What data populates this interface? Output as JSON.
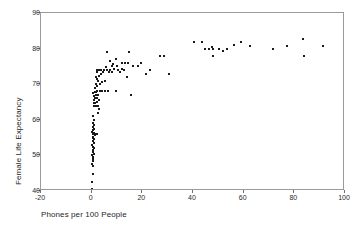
{
  "chart_data": {
    "type": "scatter",
    "title": "",
    "xlabel": "Phones per 100 People",
    "ylabel": "Female Life Expectancy",
    "xlim": [
      -20,
      100
    ],
    "ylim": [
      40,
      90
    ],
    "xticks": [
      -20,
      0,
      20,
      40,
      60,
      80,
      100
    ],
    "yticks": [
      40,
      50,
      60,
      70,
      80,
      90
    ],
    "xtick_labels": [
      "-20",
      "0",
      "20",
      "40",
      "60",
      "80",
      "100"
    ],
    "ytick_labels": [
      "40",
      "50",
      "60",
      "70",
      "80",
      "90"
    ],
    "grid": false,
    "legend": null,
    "marker": "square",
    "marker_color": "#1a1a1a",
    "frame_color": "#9a9a9a",
    "background": "#ffffff",
    "n_points": 123,
    "points": [
      [
        0.2,
        40.5
      ],
      [
        0.3,
        42.5
      ],
      [
        0.4,
        44.8
      ],
      [
        0.5,
        47.0
      ],
      [
        0.3,
        47.5
      ],
      [
        0.6,
        48.5
      ],
      [
        0.4,
        49.0
      ],
      [
        0.7,
        49.5
      ],
      [
        0.3,
        50.0
      ],
      [
        0.8,
        50.5
      ],
      [
        0.5,
        51.0
      ],
      [
        0.4,
        51.5
      ],
      [
        0.9,
        52.0
      ],
      [
        0.6,
        52.5
      ],
      [
        0.3,
        53.0
      ],
      [
        0.8,
        53.5
      ],
      [
        0.5,
        54.0
      ],
      [
        1.0,
        54.5
      ],
      [
        0.4,
        55.0
      ],
      [
        0.7,
        55.3
      ],
      [
        1.2,
        55.8
      ],
      [
        0.5,
        56.0
      ],
      [
        1.6,
        56.0
      ],
      [
        2.2,
        56.0
      ],
      [
        0.9,
        56.2
      ],
      [
        0.3,
        56.5
      ],
      [
        0.6,
        57.0
      ],
      [
        1.1,
        57.5
      ],
      [
        0.4,
        58.0
      ],
      [
        0.8,
        58.6
      ],
      [
        0.5,
        59.2
      ],
      [
        0.9,
        60.0
      ],
      [
        0.6,
        61.0
      ],
      [
        2.6,
        62.0
      ],
      [
        3.0,
        63.0
      ],
      [
        0.8,
        64.0
      ],
      [
        1.3,
        64.0
      ],
      [
        1.9,
        64.0
      ],
      [
        2.4,
        64.0
      ],
      [
        0.9,
        64.6
      ],
      [
        1.5,
        64.8
      ],
      [
        2.1,
        65.0
      ],
      [
        1.0,
        65.5
      ],
      [
        2.8,
        65.6
      ],
      [
        1.4,
        66.0
      ],
      [
        2.0,
        66.2
      ],
      [
        0.8,
        66.8
      ],
      [
        1.6,
        67.0
      ],
      [
        2.5,
        67.0
      ],
      [
        0.6,
        67.4
      ],
      [
        1.2,
        67.8
      ],
      [
        1.8,
        67.9
      ],
      [
        2.3,
        68.0
      ],
      [
        3.1,
        68.0
      ],
      [
        3.9,
        68.0
      ],
      [
        5.2,
        68.0
      ],
      [
        6.6,
        68.0
      ],
      [
        9.5,
        68.0
      ],
      [
        15.6,
        67.0
      ],
      [
        1.4,
        69.0
      ],
      [
        2.2,
        69.5
      ],
      [
        1.9,
        70.0
      ],
      [
        3.3,
        70.0
      ],
      [
        4.2,
        70.6
      ],
      [
        2.6,
        71.0
      ],
      [
        5.4,
        71.0
      ],
      [
        2.0,
        71.5
      ],
      [
        1.7,
        72.0
      ],
      [
        3.0,
        72.2
      ],
      [
        13.8,
        72.0
      ],
      [
        3.8,
        72.8
      ],
      [
        30.7,
        73.0
      ],
      [
        21.4,
        73.0
      ],
      [
        2.2,
        73.4
      ],
      [
        4.6,
        73.5
      ],
      [
        6.8,
        73.5
      ],
      [
        8.1,
        73.4
      ],
      [
        11.2,
        73.5
      ],
      [
        2.0,
        74.0
      ],
      [
        2.7,
        74.0
      ],
      [
        3.5,
        74.0
      ],
      [
        4.9,
        74.0
      ],
      [
        6.0,
        74.0
      ],
      [
        7.2,
        74.0
      ],
      [
        9.0,
        74.2
      ],
      [
        10.4,
        74.0
      ],
      [
        12.0,
        74.2
      ],
      [
        12.9,
        74.0
      ],
      [
        23.2,
        74.0
      ],
      [
        5.8,
        74.8
      ],
      [
        7.9,
        75.0
      ],
      [
        10.0,
        75.0
      ],
      [
        16.2,
        75.0
      ],
      [
        18.3,
        75.2
      ],
      [
        8.6,
        75.8
      ],
      [
        11.8,
        76.0
      ],
      [
        13.2,
        76.0
      ],
      [
        14.5,
        76.0
      ],
      [
        19.6,
        76.0
      ],
      [
        7.4,
        76.6
      ],
      [
        9.8,
        77.0
      ],
      [
        27.0,
        78.0
      ],
      [
        28.4,
        78.0
      ],
      [
        47.8,
        78.0
      ],
      [
        83.8,
        78.0
      ],
      [
        6.2,
        79.0
      ],
      [
        14.8,
        79.0
      ],
      [
        44.6,
        79.8
      ],
      [
        52.0,
        79.2
      ],
      [
        71.6,
        79.8
      ],
      [
        46.3,
        80.0
      ],
      [
        48.0,
        80.0
      ],
      [
        50.1,
        80.0
      ],
      [
        53.4,
        80.0
      ],
      [
        47.6,
        80.5
      ],
      [
        56.3,
        81.0
      ],
      [
        62.4,
        80.8
      ],
      [
        77.0,
        80.7
      ],
      [
        91.5,
        80.7
      ],
      [
        40.2,
        81.8
      ],
      [
        43.4,
        81.8
      ],
      [
        58.8,
        81.8
      ],
      [
        83.6,
        82.6
      ]
    ]
  }
}
